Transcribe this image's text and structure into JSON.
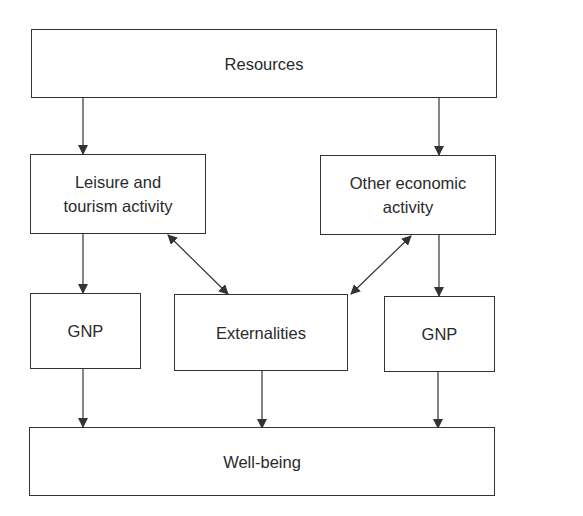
{
  "diagram": {
    "nodes": {
      "resources": "Resources",
      "leisure_line1": "Leisure and",
      "leisure_line2": "tourism activity",
      "other_line1": "Other economic",
      "other_line2": "activity",
      "gnp_left": "GNP",
      "externalities": "Externalities",
      "gnp_right": "GNP",
      "wellbeing": "Well-being"
    },
    "edges": [
      {
        "from": "Resources",
        "to": "Leisure and tourism activity",
        "type": "directed"
      },
      {
        "from": "Resources",
        "to": "Other economic activity",
        "type": "directed"
      },
      {
        "from": "Leisure and tourism activity",
        "to": "GNP (left)",
        "type": "directed"
      },
      {
        "from": "Other economic activity",
        "to": "GNP (right)",
        "type": "directed"
      },
      {
        "from": "Leisure and tourism activity",
        "to": "Externalities",
        "type": "bidirectional"
      },
      {
        "from": "Other economic activity",
        "to": "Externalities",
        "type": "bidirectional"
      },
      {
        "from": "GNP (left)",
        "to": "Well-being",
        "type": "directed"
      },
      {
        "from": "Externalities",
        "to": "Well-being",
        "type": "directed"
      },
      {
        "from": "GNP (right)",
        "to": "Well-being",
        "type": "directed"
      }
    ],
    "colors": {
      "line": "#333333",
      "background": "#ffffff"
    }
  }
}
